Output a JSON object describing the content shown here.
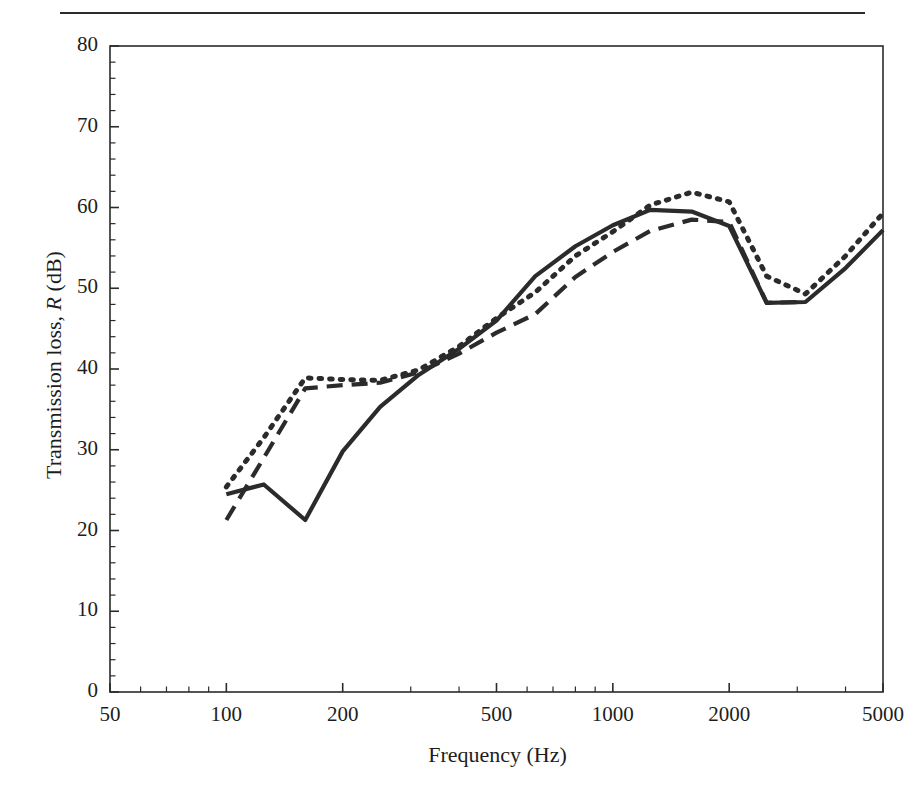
{
  "figure": {
    "has_top_rule": true,
    "background": "#ffffff",
    "ink_color": "#2b2b2b"
  },
  "axes": {
    "x_title": "Frequency (Hz)",
    "y_title_pre": "Transmission loss, ",
    "y_title_sym": "R",
    "y_title_post": " (dB)",
    "x_ticks": [
      "50",
      "100",
      "200",
      "500",
      "1000",
      "2000",
      "5000"
    ],
    "y_ticks": [
      "0",
      "10",
      "20",
      "30",
      "40",
      "50",
      "60",
      "70",
      "80"
    ]
  },
  "chart_data": {
    "type": "line",
    "title": "",
    "xlabel": "Frequency (Hz)",
    "ylabel": "Transmission loss, R (dB)",
    "xscale": "log",
    "xlim": [
      50,
      5000
    ],
    "ylim": [
      0,
      80
    ],
    "xticks": [
      50,
      100,
      200,
      500,
      1000,
      2000,
      5000
    ],
    "yticks": [
      0,
      10,
      20,
      30,
      40,
      50,
      60,
      70,
      80
    ],
    "grid": false,
    "legend": "none",
    "series": [
      {
        "name": "solid",
        "style": "solid",
        "x": [
          100,
          125,
          160,
          200,
          250,
          315,
          400,
          500,
          630,
          800,
          1000,
          1250,
          1600,
          2000,
          2500,
          3150,
          4000,
          5000
        ],
        "y": [
          24.5,
          25.7,
          21.3,
          29.8,
          35.3,
          39.3,
          42.5,
          46.0,
          51.5,
          55.2,
          57.8,
          59.7,
          59.5,
          57.7,
          48.2,
          48.3,
          52.5,
          57.2
        ]
      },
      {
        "name": "dashed",
        "style": "dashed",
        "x": [
          100,
          125,
          160,
          200,
          250,
          315,
          400,
          500,
          630,
          800,
          1000,
          1250,
          1600,
          2000,
          2500,
          3150
        ],
        "y": [
          21.3,
          29.0,
          37.6,
          38.0,
          38.3,
          39.6,
          41.9,
          44.5,
          46.8,
          51.4,
          54.5,
          57.1,
          58.5,
          58.2,
          48.2,
          48.3
        ]
      },
      {
        "name": "dotted",
        "style": "dotted",
        "x": [
          100,
          125,
          160,
          200,
          250,
          315,
          400,
          500,
          630,
          800,
          1000,
          1250,
          1600,
          2000,
          2500,
          3150,
          4000,
          5000
        ],
        "y": [
          25.4,
          31.5,
          38.9,
          38.7,
          38.6,
          39.9,
          42.8,
          46.3,
          49.5,
          54.0,
          57.0,
          60.3,
          61.9,
          60.7,
          51.5,
          49.3,
          54.0,
          59.3
        ]
      }
    ]
  }
}
